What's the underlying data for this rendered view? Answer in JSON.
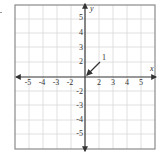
{
  "figure": {
    "type": "coordinate-plane",
    "x_axis_label": "x",
    "y_axis_label": "y",
    "x_range": [
      -5,
      5
    ],
    "y_range": [
      -5,
      5
    ],
    "grid": true,
    "x_tick_labels": [
      "-5",
      "-4",
      "-3",
      "-2",
      "2",
      "3",
      "4",
      "5"
    ],
    "y_tick_labels": [
      "5",
      "4",
      "3",
      "2",
      "-2",
      "-3",
      "-4",
      "-5"
    ],
    "annotation": {
      "label": "1",
      "description": "arrow pointing to origin"
    },
    "colors": {
      "grid": "#d4d4d4",
      "border": "#8a8a8a",
      "axis": "#333333",
      "text": "#333333"
    }
  }
}
